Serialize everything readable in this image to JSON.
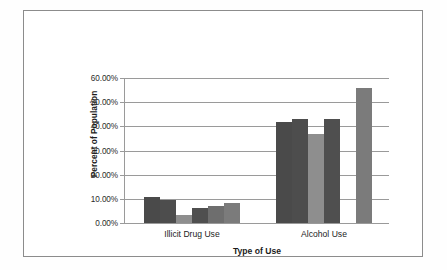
{
  "chart_data": {
    "type": "bar",
    "title": "",
    "xlabel": "Type of Use",
    "ylabel": "Percent of Population",
    "categories": [
      "Illicit Drug Use",
      "Alcohol Use"
    ],
    "ylim": [
      0,
      60
    ],
    "ytick_labels": [
      "0.00%",
      "10.00%",
      "20.00%",
      "30.00%",
      "40.00%",
      "50.00%",
      "60.00%"
    ],
    "ytick_values": [
      0,
      10,
      20,
      30,
      40,
      50,
      60
    ],
    "grid": true,
    "legend": "none",
    "legend_position": "none",
    "series": [
      {
        "name": "Series 1",
        "values": [
          10.8,
          41.8
        ],
        "color": "#4a4a4a"
      },
      {
        "name": "Series 2",
        "values": [
          9.7,
          43.2
        ],
        "color": "#4d4d4d"
      },
      {
        "name": "Series 3",
        "values": [
          3.2,
          36.8
        ],
        "color": "#8e8e8e"
      },
      {
        "name": "Series 4",
        "values": [
          6.2,
          43.2
        ],
        "color": "#4f4f4f"
      },
      {
        "name": "Series 5",
        "values": [
          7.2,
          0.0
        ],
        "color": "#6e6e6e"
      },
      {
        "name": "Series 6",
        "values": [
          8.4,
          56.0
        ],
        "color": "#7b7b7b"
      }
    ]
  },
  "colors": {
    "frame": "#8c8c8c",
    "gridline": "#9a9a9a",
    "text": "#1c1c1c",
    "background": "#ffffff"
  }
}
